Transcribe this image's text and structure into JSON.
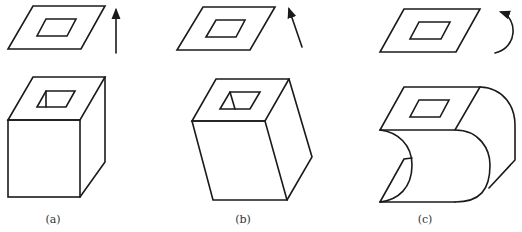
{
  "figure": {
    "panels": [
      {
        "id": "a",
        "label": "(a)",
        "motion": "translation-vertical",
        "motion_icon": "up-arrow-icon",
        "profile": "square plate with square hole",
        "result_solid": "straight prism with square through-hole"
      },
      {
        "id": "b",
        "label": "(b)",
        "motion": "translation-oblique",
        "motion_icon": "oblique-arrow-icon",
        "profile": "square plate with square hole",
        "result_solid": "oblique prism with square through-hole"
      },
      {
        "id": "c",
        "label": "(c)",
        "motion": "rotation",
        "motion_icon": "curved-arrow-icon",
        "profile": "square plate with square hole",
        "result_solid": "curved swept solid"
      }
    ],
    "colors": {
      "stroke": "#1a1a1a",
      "background": "#ffffff",
      "label": "#333333"
    }
  }
}
